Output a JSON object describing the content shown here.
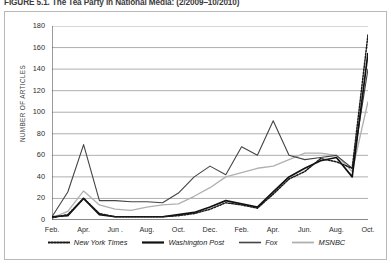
{
  "figure": {
    "caption": "FIGURE 5.1. The Tea Party in National Media: (2/2009–10/2010)"
  },
  "axes": {
    "y_title": "NUMBER OF ARTICLES",
    "y_ticks": [
      "180",
      "160",
      "140",
      "120",
      "100",
      "80",
      "60",
      "40",
      "20",
      "0"
    ],
    "x_ticks": [
      "Feb.",
      "Apr.",
      "Jun .",
      "Aug.",
      "Oct.",
      "Dec.",
      "Feb.",
      "Apr.",
      "Jun.",
      "Aug.",
      "Oct."
    ]
  },
  "legend": {
    "items": [
      {
        "label": "New York Times",
        "style": "dotted",
        "color": "#1a1a1a"
      },
      {
        "label": "Washington Post",
        "style": "solid-thick",
        "color": "#111111"
      },
      {
        "label": "Fox",
        "style": "solid-medium",
        "color": "#444444"
      },
      {
        "label": "MSNBC",
        "style": "solid-light",
        "color": "#b0b0b0"
      }
    ]
  },
  "chart_data": {
    "type": "line",
    "title": "FIGURE 5.1. The Tea Party in National Media: (2/2009–10/2010)",
    "xlabel": "",
    "ylabel": "NUMBER OF ARTICLES",
    "ylim": [
      0,
      180
    ],
    "ytick_step": 20,
    "grid": "horizontal",
    "legend_position": "bottom",
    "x": [
      "Feb. 2009",
      "Mar. 2009",
      "Apr. 2009",
      "May 2009",
      "Jun. 2009",
      "Jul. 2009",
      "Aug. 2009",
      "Sep. 2009",
      "Oct. 2009",
      "Nov. 2009",
      "Dec. 2009",
      "Jan. 2010",
      "Feb. 2010",
      "Mar. 2010",
      "Apr. 2010",
      "May 2010",
      "Jun. 2010",
      "Jul. 2010",
      "Aug. 2010",
      "Sep. 2010",
      "Oct. 2010"
    ],
    "categories": [
      "Feb.",
      "",
      "Apr.",
      "",
      "Jun .",
      "",
      "Aug.",
      "",
      "Oct.",
      "",
      "Dec.",
      "",
      "Feb.",
      "",
      "Apr.",
      "",
      "Jun.",
      "",
      "Aug.",
      "",
      "Oct."
    ],
    "series": [
      {
        "name": "New York Times",
        "style": "dotted",
        "color": "#1a1a1a",
        "values": [
          2,
          5,
          20,
          6,
          3,
          3,
          3,
          3,
          4,
          6,
          10,
          16,
          14,
          11,
          24,
          38,
          45,
          57,
          54,
          48,
          172
        ]
      },
      {
        "name": "Washington Post",
        "style": "solid-thick",
        "color": "#111111",
        "values": [
          3,
          4,
          20,
          5,
          3,
          3,
          3,
          3,
          5,
          7,
          12,
          18,
          15,
          12,
          26,
          40,
          48,
          55,
          58,
          40,
          155
        ]
      },
      {
        "name": "Fox",
        "style": "solid-medium",
        "color": "#444444",
        "values": [
          3,
          26,
          70,
          18,
          18,
          17,
          17,
          16,
          25,
          40,
          50,
          42,
          68,
          60,
          92,
          60,
          56,
          58,
          60,
          48,
          140
        ]
      },
      {
        "name": "MSNBC",
        "style": "solid-light",
        "color": "#b0b0b0",
        "values": [
          2,
          8,
          27,
          14,
          10,
          9,
          12,
          14,
          15,
          22,
          30,
          40,
          44,
          48,
          50,
          56,
          62,
          62,
          60,
          45,
          110
        ]
      }
    ]
  }
}
